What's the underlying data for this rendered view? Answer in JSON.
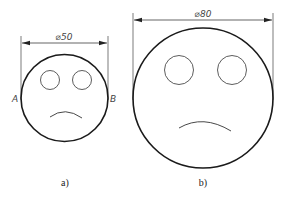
{
  "figures": [
    {
      "id": "a",
      "caption": "a)",
      "dimension_label": "⌀50",
      "point_labels": [
        "A",
        "B"
      ]
    },
    {
      "id": "b",
      "caption": "b)",
      "dimension_label": "⌀80"
    }
  ],
  "colors": {
    "outline": "#1a1a1a",
    "thin": "#333333"
  }
}
